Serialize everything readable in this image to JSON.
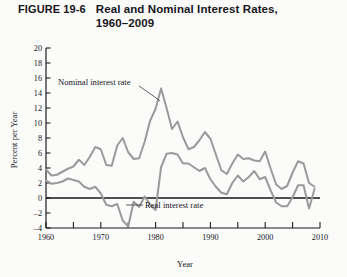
{
  "figure": {
    "number_label": "FIGURE 19-6",
    "title_line1": "Real and Nominal Interest Rates,",
    "title_line2": "1960–2009"
  },
  "colors": {
    "series_line": "#9a9a9c",
    "axis": "#16151a",
    "background": "#fbfbfa"
  },
  "chart_data": {
    "type": "line",
    "title": "Real and Nominal Interest Rates, 1960–2009",
    "xlabel": "Year",
    "ylabel": "Percent per Year",
    "xlim": [
      1960,
      2010
    ],
    "ylim": [
      -4,
      20
    ],
    "x_ticks_major": [
      1960,
      1970,
      1980,
      1990,
      2000,
      2010
    ],
    "x_ticks_minor": [
      1965,
      1975,
      1985,
      1995,
      2005
    ],
    "y_ticks": [
      -4,
      -2,
      0,
      2,
      4,
      6,
      8,
      10,
      12,
      14,
      16,
      18,
      20
    ],
    "grid": false,
    "legend": "inline-annotations",
    "annotations": [
      {
        "text": "Nominal interest rate",
        "points_to_series": "Nominal interest rate"
      },
      {
        "text": "Real interest rate",
        "points_to_series": "Real interest rate"
      }
    ],
    "x": [
      1960,
      1961,
      1962,
      1963,
      1964,
      1965,
      1966,
      1967,
      1968,
      1969,
      1970,
      1971,
      1972,
      1973,
      1974,
      1975,
      1976,
      1977,
      1978,
      1979,
      1980,
      1981,
      1982,
      1983,
      1984,
      1985,
      1986,
      1987,
      1988,
      1989,
      1990,
      1991,
      1992,
      1993,
      1994,
      1995,
      1996,
      1997,
      1998,
      1999,
      2000,
      2001,
      2002,
      2003,
      2004,
      2005,
      2006,
      2007,
      2008,
      2009
    ],
    "series": [
      {
        "name": "Nominal interest rate",
        "values": [
          3.8,
          3.0,
          3.1,
          3.5,
          3.9,
          4.2,
          5.1,
          4.4,
          5.5,
          6.8,
          6.5,
          4.4,
          4.3,
          7.0,
          8.0,
          6.1,
          5.2,
          5.3,
          7.5,
          10.3,
          11.9,
          14.6,
          12.0,
          9.2,
          10.2,
          8.1,
          6.5,
          6.8,
          7.7,
          8.8,
          7.9,
          5.8,
          3.7,
          3.2,
          4.6,
          5.8,
          5.2,
          5.3,
          5.0,
          4.9,
          6.2,
          3.9,
          1.8,
          1.2,
          1.6,
          3.4,
          4.9,
          4.6,
          2.0,
          1.5
        ]
      },
      {
        "name": "Real interest rate",
        "values": [
          2.3,
          1.9,
          2.0,
          2.2,
          2.6,
          2.4,
          2.2,
          1.5,
          1.2,
          1.5,
          0.6,
          -0.9,
          -1.1,
          -0.8,
          -3.0,
          -3.8,
          -0.5,
          -1.2,
          0.2,
          -0.9,
          -1.6,
          4.1,
          5.9,
          6.0,
          5.8,
          4.6,
          4.6,
          4.1,
          3.6,
          4.0,
          2.5,
          1.5,
          0.7,
          0.5,
          2.0,
          3.0,
          2.2,
          2.8,
          3.6,
          2.5,
          2.8,
          1.0,
          -0.6,
          -1.1,
          -1.1,
          0.1,
          1.7,
          1.7,
          -1.4,
          1.2
        ]
      }
    ]
  },
  "axes": {
    "y_title": "Percent per Year",
    "x_title": "Year",
    "y_tick_labels": [
      "20",
      "18",
      "16",
      "14",
      "12",
      "10",
      "8",
      "6",
      "4",
      "2",
      "0",
      "–2",
      "–4"
    ],
    "x_tick_labels": [
      "1960",
      "1970",
      "1980",
      "1990",
      "2000",
      "2010"
    ]
  },
  "labels": {
    "nominal": "Nominal interest rate",
    "real": "Real interest rate"
  }
}
